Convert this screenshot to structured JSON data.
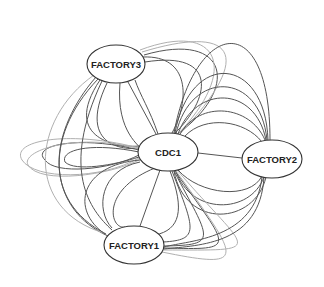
{
  "diagram": {
    "type": "network-graph",
    "nodes": [
      {
        "id": "FACTORY3",
        "label": "FACTORY3",
        "cx": 116,
        "cy": 64,
        "rx": 29,
        "ry": 19
      },
      {
        "id": "CDC1",
        "label": "CDC1",
        "cx": 168,
        "cy": 152,
        "rx": 30,
        "ry": 19
      },
      {
        "id": "FACTORY2",
        "label": "FACTORY2",
        "cx": 272,
        "cy": 159,
        "rx": 30,
        "ry": 19
      },
      {
        "id": "FACTORY1",
        "label": "FACTORY1",
        "cx": 134,
        "cy": 245,
        "rx": 30,
        "ry": 19
      }
    ],
    "edge_colors": {
      "dark": "#555555",
      "light": "#b0b0b0"
    },
    "edges": [
      {
        "from": "FACTORY3",
        "to": "CDC1",
        "color": "dark",
        "d": "M128,82 L156,134"
      },
      {
        "from": "FACTORY3",
        "to": "CDC1",
        "color": "dark",
        "d": "M120,83 C115,140 150,150 139,150"
      },
      {
        "from": "FACTORY3",
        "to": "CDC1",
        "color": "dark",
        "d": "M107,83 C75,150 130,150 139,148"
      },
      {
        "from": "FACTORY3",
        "to": "CDC1",
        "color": "dark",
        "d": "M100,80 C60,140 120,148 139,146"
      },
      {
        "from": "FACTORY3",
        "to": "CDC1",
        "color": "dark",
        "d": "M143,57 C190,55 190,100 172,133"
      },
      {
        "from": "FACTORY3",
        "to": "CDC1",
        "color": "dark",
        "d": "M145,62 C220,50 210,100 174,134"
      },
      {
        "from": "FACTORY3",
        "to": "CDC1",
        "color": "dark",
        "d": "M144,55 C230,30 240,90 176,135"
      },
      {
        "from": "FACTORY3",
        "to": "CDC1",
        "color": "light",
        "d": "M142,52 C230,25 260,50 178,136"
      },
      {
        "from": "FACTORY3",
        "to": "CDC1",
        "color": "light",
        "d": "M140,50 C220,20 240,70 177,135"
      },
      {
        "from": "CDC1",
        "to": "FACTORY2",
        "color": "dark",
        "d": "M198,153 L242,158"
      },
      {
        "from": "CDC1",
        "to": "FACTORY2",
        "color": "dark",
        "d": "M180,134 C200,100 250,105 265,140"
      },
      {
        "from": "CDC1",
        "to": "FACTORY2",
        "color": "dark",
        "d": "M178,134 C195,85 255,85 266,140"
      },
      {
        "from": "CDC1",
        "to": "FACTORY2",
        "color": "dark",
        "d": "M176,134 C190,70 260,70 267,140"
      },
      {
        "from": "CDC1",
        "to": "FACTORY2",
        "color": "dark",
        "d": "M175,133 C190,50 265,55 268,140"
      },
      {
        "from": "CDC1",
        "to": "FACTORY2",
        "color": "dark",
        "d": "M174,133 C195,20 270,5 270,140"
      },
      {
        "from": "CDC1",
        "to": "FACTORY2",
        "color": "dark",
        "d": "M185,136 C205,115 245,120 262,142"
      },
      {
        "from": "CDC1",
        "to": "FACTORY2",
        "color": "dark",
        "d": "M178,170 C200,195 250,200 262,176"
      },
      {
        "from": "CDC1",
        "to": "FACTORY2",
        "color": "dark",
        "d": "M176,171 C190,215 250,215 264,177"
      },
      {
        "from": "CDC1",
        "to": "FACTORY2",
        "color": "dark",
        "d": "M174,171 C185,230 255,225 266,177"
      },
      {
        "from": "CDC1",
        "to": "FACTORY1",
        "color": "dark",
        "d": "M160,170 L140,226"
      },
      {
        "from": "CDC1",
        "to": "FACTORY1",
        "color": "dark",
        "d": "M155,168 C100,190 110,230 125,227"
      },
      {
        "from": "CDC1",
        "to": "FACTORY1",
        "color": "dark",
        "d": "M170,171 C185,210 180,230 155,235"
      },
      {
        "from": "CDC1",
        "to": "FACTORY1",
        "color": "dark",
        "d": "M172,171 C195,230 200,240 163,242"
      },
      {
        "from": "CDC1",
        "to": "FACTORY1",
        "color": "dark",
        "d": "M174,171 C210,240 220,245 164,246"
      },
      {
        "from": "CDC1",
        "to": "FACTORY1",
        "color": "dark",
        "d": "M175,171 C230,250 240,250 164,248"
      },
      {
        "from": "CDC1",
        "to": "FACTORY1",
        "color": "light",
        "d": "M176,171 C240,260 250,270 162,252"
      },
      {
        "from": "CDC1",
        "to": "FACTORY1",
        "color": "light",
        "d": "M177,170 C250,255 270,250 163,250"
      },
      {
        "from": "FACTORY2",
        "to": "FACTORY1",
        "color": "dark",
        "d": "M262,177 C255,240 190,240 164,247"
      },
      {
        "from": "FACTORY2",
        "to": "FACTORY1",
        "color": "dark",
        "d": "M264,177 C260,245 200,245 164,249"
      },
      {
        "from": "CDC1",
        "to": "CDC1-left-loops",
        "color": "dark",
        "d": "M139,150 C80,135 30,145 45,160 C55,175 110,170 139,155"
      },
      {
        "from": "CDC1",
        "to": "CDC1-left-loops",
        "color": "dark",
        "d": "M139,152 C90,142 60,150 65,162 C75,172 115,165 139,157"
      },
      {
        "from": "CDC1",
        "to": "CDC1-left-loops",
        "color": "light",
        "d": "M139,148 C70,130 10,140 22,160 C35,180 100,180 139,158"
      },
      {
        "from": "CDC1",
        "to": "CDC1-left-loops",
        "color": "light",
        "d": "M139,149 C80,132 20,150 28,165 C40,185 110,175 139,160"
      },
      {
        "from": "FACTORY3",
        "to": "FACTORY1",
        "color": "dark",
        "d": "M98,79 C40,140 50,210 108,236"
      },
      {
        "from": "FACTORY3",
        "to": "FACTORY1",
        "color": "dark",
        "d": "M96,77 C50,130 40,200 106,234"
      },
      {
        "from": "FACTORY3",
        "to": "FACTORY1",
        "color": "dark",
        "d": "M102,81 C60,170 90,210 112,230"
      },
      {
        "from": "FACTORY3",
        "to": "FACTORY1",
        "color": "light",
        "d": "M94,75 C30,120 25,210 104,233"
      },
      {
        "from": "CDC1",
        "to": "FACTORY3-right",
        "color": "dark",
        "d": "M158,134 C150,110 140,95 135,80"
      },
      {
        "from": "CDC1",
        "to": "FACTORY1-left",
        "color": "dark",
        "d": "M140,160 C80,165 70,210 105,234"
      },
      {
        "from": "CDC1",
        "to": "FACTORY1-left",
        "color": "dark",
        "d": "M140,162 C100,170 95,210 112,228"
      }
    ]
  }
}
